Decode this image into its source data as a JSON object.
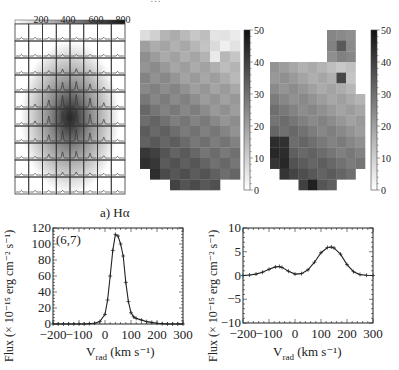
{
  "figure": {
    "top_title_partial": "…",
    "left_map": {
      "title": "Hα flux map with spectra grid",
      "colorbar": {
        "orientation": "horizontal",
        "ticks": [
          "200",
          "400",
          "600",
          "800"
        ],
        "range": [
          0,
          800
        ]
      },
      "grid": {
        "cols": 8,
        "rows": 10
      }
    },
    "middle_map": {
      "colorbar": {
        "orientation": "vertical",
        "ticks": [
          "0",
          "10",
          "20",
          "30",
          "40",
          "50"
        ],
        "range": [
          0,
          50
        ]
      }
    },
    "right_map": {
      "colorbar": {
        "orientation": "vertical",
        "ticks": [
          "0",
          "10",
          "20",
          "30",
          "40",
          "50"
        ],
        "range": [
          0,
          50
        ]
      }
    },
    "spectrum_left": {
      "title": "a) Hα",
      "annotation": "(6,7)",
      "ylabel": "Flux (× 10⁻¹⁵ erg cm⁻² s⁻¹)",
      "xlabel_main": "V",
      "xlabel_sub": "rad",
      "xlabel_units": " (km s⁻¹)",
      "xticks": [
        "−200",
        "−100",
        "0",
        "100",
        "200",
        "300"
      ],
      "yticks": [
        "0",
        "20",
        "40",
        "60",
        "80",
        "100",
        "120"
      ]
    },
    "spectrum_right": {
      "ylabel": "Flux (× 10⁻¹⁵ erg cm⁻² s⁻¹)",
      "xlabel_main": "V",
      "xlabel_sub": "rad",
      "xlabel_units": " (km s⁻¹)",
      "xticks": [
        "−200",
        "−100",
        "0",
        "100",
        "200",
        "300"
      ],
      "yticks": [
        "−10",
        "−5",
        "0",
        "5",
        "10"
      ]
    }
  },
  "chart_data": [
    {
      "type": "heatmap",
      "title": "Hα flux map (spectra grid overlay)",
      "colorbar_range": [
        0,
        800
      ],
      "colorbar_ticks": [
        200,
        400,
        600,
        800
      ],
      "grid_cols": 8,
      "grid_rows": 10,
      "peak_cell": [
        5,
        5
      ],
      "note": "Each cell contains a small Hα line profile; emission peaks near grid centre"
    },
    {
      "type": "heatmap",
      "title": "Velocity dispersion / parameter map (middle)",
      "colorbar_range": [
        0,
        50
      ],
      "colorbar_ticks": [
        0,
        10,
        20,
        30,
        40,
        50
      ],
      "grid_cols": 10,
      "grid_rows": 15
    },
    {
      "type": "heatmap",
      "title": "Velocity dispersion / parameter map (right)",
      "colorbar_range": [
        0,
        50
      ],
      "colorbar_ticks": [
        0,
        10,
        20,
        30,
        40,
        50
      ],
      "grid_cols": 10,
      "grid_rows": 15
    },
    {
      "type": "line",
      "title": "a) Hα",
      "annotation": "(6,7)",
      "xlabel": "V_rad (km s^-1)",
      "ylabel": "Flux (× 10^-15 erg cm^-2 s^-1)",
      "xlim": [
        -200,
        300
      ],
      "ylim": [
        0,
        120
      ],
      "x": [
        -200,
        -180,
        -160,
        -140,
        -120,
        -100,
        -80,
        -60,
        -40,
        -20,
        0,
        10,
        20,
        30,
        40,
        50,
        60,
        70,
        80,
        90,
        100,
        110,
        120,
        140,
        160,
        180,
        200,
        220,
        240,
        260,
        280,
        300
      ],
      "series": [
        {
          "name": "observed (+)",
          "values": [
            0,
            0,
            0,
            0,
            0,
            0,
            0,
            0.5,
            1,
            3,
            12,
            30,
            60,
            92,
            112,
            110,
            100,
            85,
            52,
            28,
            14,
            9,
            7,
            5,
            3,
            2,
            1,
            0.5,
            0,
            0,
            0,
            0
          ]
        },
        {
          "name": "fit",
          "values": [
            0,
            0,
            0,
            0,
            0,
            0,
            0,
            0.5,
            1,
            3,
            12,
            30,
            60,
            92,
            112,
            110,
            100,
            85,
            52,
            28,
            14,
            9,
            7,
            5,
            3,
            2,
            1,
            0.5,
            0,
            0,
            0,
            0
          ]
        }
      ]
    },
    {
      "type": "line",
      "title": "",
      "xlabel": "V_rad (km s^-1)",
      "ylabel": "Flux (× 10^-15 erg cm^-2 s^-1)",
      "xlim": [
        -200,
        300
      ],
      "ylim": [
        -10,
        10
      ],
      "x": [
        -200,
        -175,
        -150,
        -125,
        -100,
        -75,
        -60,
        -50,
        -25,
        0,
        25,
        50,
        75,
        100,
        125,
        140,
        150,
        175,
        200,
        225,
        250,
        275,
        300
      ],
      "series": [
        {
          "name": "observed (+)",
          "values": [
            0,
            0.1,
            0.3,
            0.7,
            1.3,
            1.8,
            1.9,
            1.7,
            0.9,
            0.3,
            0.4,
            1.2,
            2.8,
            4.8,
            5.9,
            6.0,
            5.8,
            4.5,
            2.3,
            0.8,
            0.2,
            0.05,
            0
          ]
        },
        {
          "name": "fit",
          "values": [
            0,
            0.1,
            0.3,
            0.7,
            1.3,
            1.8,
            1.9,
            1.7,
            0.9,
            0.3,
            0.4,
            1.2,
            2.8,
            4.8,
            5.9,
            6.0,
            5.8,
            4.5,
            2.3,
            0.8,
            0.2,
            0.05,
            0
          ]
        }
      ]
    }
  ]
}
